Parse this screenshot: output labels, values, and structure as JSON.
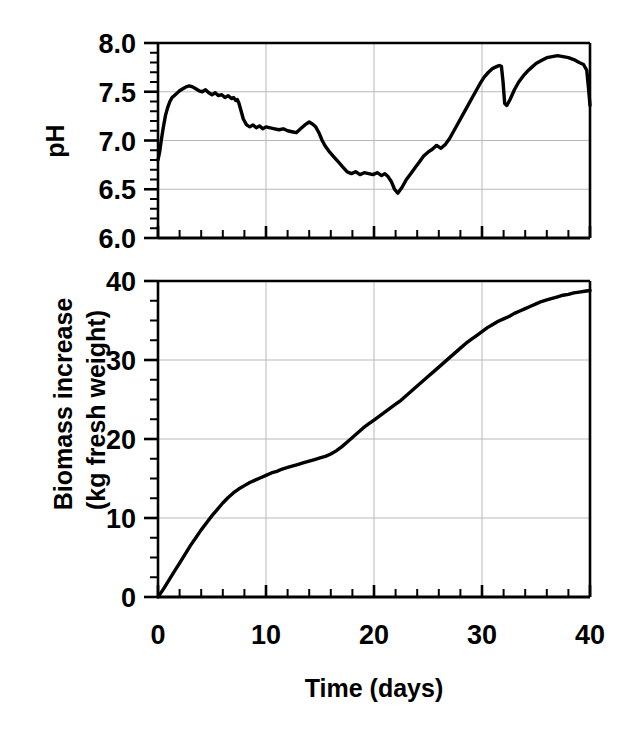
{
  "figure": {
    "title": "",
    "background_color": "#ffffff",
    "line_color": "#000000",
    "grid_color": "#b9b9b9"
  },
  "xaxis": {
    "label": "Time (days)",
    "ticks": [
      "0",
      "10",
      "20",
      "30",
      "40"
    ],
    "min": 0,
    "max": 40,
    "major_step": 10,
    "minor_step": 2
  },
  "panels": {
    "top": {
      "ylabel": "pH",
      "yticks": [
        "8.0",
        "7.5",
        "7.0",
        "6.5",
        "6.0"
      ]
    },
    "bottom": {
      "ylabel_line1": "Biomass increase",
      "ylabel_line2": "(kg fresh weight)",
      "yticks": [
        "40",
        "30",
        "20",
        "10",
        "0"
      ]
    }
  },
  "chart_data": [
    {
      "type": "line",
      "title": "pH",
      "xlabel": "Time (days)",
      "ylabel": "pH",
      "xlim": [
        0,
        40
      ],
      "ylim": [
        6.0,
        8.0
      ],
      "xticks": [
        0,
        10,
        20,
        30,
        40
      ],
      "yticks": [
        6.0,
        6.5,
        7.0,
        7.5,
        8.0
      ],
      "grid": true,
      "legend": "none",
      "series": [
        {
          "name": "pH",
          "x": [
            0.0,
            0.15,
            0.3,
            0.5,
            0.7,
            0.9,
            1.1,
            1.3,
            1.5,
            1.8,
            2.0,
            2.3,
            2.6,
            2.9,
            3.2,
            3.5,
            3.8,
            4.1,
            4.4,
            4.7,
            5.0,
            5.3,
            5.6,
            5.9,
            6.2,
            6.5,
            6.8,
            7.0,
            7.2,
            7.35,
            7.5,
            7.7,
            7.9,
            8.2,
            8.5,
            8.8,
            9.1,
            9.4,
            9.7,
            10.0,
            10.4,
            10.8,
            11.2,
            11.6,
            12.0,
            12.4,
            12.8,
            13.2,
            13.6,
            14.0,
            14.3,
            14.6,
            14.9,
            15.2,
            15.5,
            15.9,
            16.3,
            16.7,
            17.1,
            17.5,
            17.9,
            18.3,
            18.7,
            19.1,
            19.5,
            19.9,
            20.3,
            20.7,
            21.0,
            21.3,
            21.6,
            21.9,
            22.2,
            22.6,
            23.0,
            23.4,
            23.8,
            24.2,
            24.6,
            25.0,
            25.4,
            25.8,
            26.2,
            26.6,
            27.0,
            27.4,
            27.8,
            28.2,
            28.6,
            29.0,
            29.4,
            29.8,
            30.2,
            30.6,
            31.0,
            31.4,
            31.6,
            31.8,
            31.95,
            32.1,
            32.3,
            32.6,
            33.0,
            33.4,
            33.8,
            34.2,
            34.6,
            35.0,
            35.5,
            36.0,
            36.5,
            37.0,
            37.5,
            38.0,
            38.5,
            39.0,
            39.4,
            39.7,
            39.85,
            40.0
          ],
          "y": [
            6.8,
            6.88,
            7.0,
            7.14,
            7.26,
            7.34,
            7.4,
            7.44,
            7.46,
            7.49,
            7.51,
            7.53,
            7.55,
            7.56,
            7.55,
            7.53,
            7.51,
            7.5,
            7.52,
            7.49,
            7.47,
            7.49,
            7.46,
            7.47,
            7.44,
            7.46,
            7.43,
            7.44,
            7.41,
            7.42,
            7.38,
            7.3,
            7.22,
            7.16,
            7.14,
            7.16,
            7.13,
            7.15,
            7.12,
            7.14,
            7.13,
            7.12,
            7.11,
            7.12,
            7.1,
            7.09,
            7.08,
            7.12,
            7.16,
            7.19,
            7.17,
            7.14,
            7.08,
            7.0,
            6.94,
            6.88,
            6.83,
            6.78,
            6.73,
            6.68,
            6.66,
            6.68,
            6.65,
            6.67,
            6.66,
            6.65,
            6.67,
            6.64,
            6.66,
            6.63,
            6.58,
            6.5,
            6.46,
            6.52,
            6.6,
            6.66,
            6.72,
            6.78,
            6.84,
            6.88,
            6.91,
            6.95,
            6.92,
            6.96,
            7.02,
            7.1,
            7.18,
            7.26,
            7.34,
            7.42,
            7.5,
            7.58,
            7.65,
            7.7,
            7.74,
            7.76,
            7.77,
            7.76,
            7.6,
            7.38,
            7.36,
            7.42,
            7.52,
            7.6,
            7.66,
            7.71,
            7.75,
            7.79,
            7.82,
            7.85,
            7.86,
            7.87,
            7.86,
            7.85,
            7.83,
            7.8,
            7.78,
            7.72,
            7.55,
            7.36
          ]
        }
      ]
    },
    {
      "type": "line",
      "title": "Biomass increase",
      "xlabel": "Time (days)",
      "ylabel": "Biomass increase (kg fresh weight)",
      "xlim": [
        0,
        40
      ],
      "ylim": [
        0,
        40
      ],
      "xticks": [
        0,
        10,
        20,
        30,
        40
      ],
      "yticks": [
        0,
        10,
        20,
        30,
        40
      ],
      "grid": true,
      "legend": "none",
      "series": [
        {
          "name": "Biomass increase",
          "x": [
            0.0,
            0.5,
            1.0,
            1.5,
            2.0,
            2.5,
            3.0,
            3.5,
            4.0,
            4.5,
            5.0,
            5.5,
            6.0,
            6.5,
            7.0,
            7.5,
            8.0,
            8.5,
            9.0,
            9.5,
            10.0,
            10.5,
            11.0,
            11.5,
            12.0,
            12.5,
            13.0,
            13.5,
            14.0,
            14.5,
            15.0,
            15.5,
            16.0,
            16.5,
            17.0,
            17.5,
            18.0,
            18.5,
            19.0,
            19.5,
            20.0,
            20.5,
            21.0,
            21.5,
            22.0,
            22.5,
            23.0,
            23.5,
            24.0,
            24.5,
            25.0,
            25.5,
            26.0,
            26.5,
            27.0,
            27.5,
            28.0,
            28.5,
            29.0,
            29.5,
            30.0,
            30.5,
            31.0,
            31.5,
            32.0,
            32.5,
            33.0,
            33.5,
            34.0,
            34.5,
            35.0,
            35.5,
            36.0,
            36.5,
            37.0,
            37.5,
            38.0,
            38.5,
            39.0,
            39.5,
            40.0
          ],
          "y": [
            0.0,
            1.0,
            2.1,
            3.2,
            4.3,
            5.4,
            6.5,
            7.5,
            8.5,
            9.4,
            10.3,
            11.1,
            11.9,
            12.6,
            13.2,
            13.7,
            14.1,
            14.5,
            14.8,
            15.1,
            15.4,
            15.7,
            15.9,
            16.2,
            16.4,
            16.6,
            16.8,
            17.0,
            17.2,
            17.4,
            17.6,
            17.8,
            18.1,
            18.5,
            19.0,
            19.6,
            20.2,
            20.8,
            21.4,
            21.9,
            22.4,
            22.9,
            23.4,
            23.9,
            24.4,
            24.9,
            25.5,
            26.1,
            26.7,
            27.3,
            27.9,
            28.5,
            29.1,
            29.7,
            30.3,
            30.9,
            31.5,
            32.1,
            32.6,
            33.1,
            33.6,
            34.1,
            34.5,
            34.9,
            35.2,
            35.5,
            35.9,
            36.2,
            36.5,
            36.8,
            37.1,
            37.4,
            37.6,
            37.8,
            38.0,
            38.2,
            38.3,
            38.5,
            38.6,
            38.7,
            38.8
          ]
        }
      ]
    }
  ]
}
